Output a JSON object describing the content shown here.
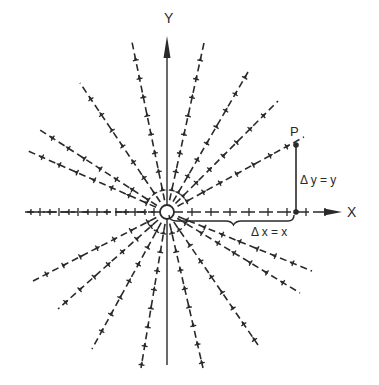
{
  "diagram": {
    "type": "radial vector field",
    "origin": [
      167,
      212
    ],
    "axes": {
      "x_label": "X",
      "y_label": "Y"
    },
    "point": {
      "label": "P",
      "position": [
        296,
        145
      ]
    },
    "annotations": {
      "delta_x": "Δ x = x",
      "delta_y": "Δ y = y"
    },
    "colors": {
      "ink": "#2a2a2a",
      "background": "#ffffff"
    },
    "rays": [
      {
        "end": [
          132,
          42
        ],
        "dir": "out"
      },
      {
        "end": [
          204,
          43
        ],
        "dir": "out"
      },
      {
        "end": [
          80,
          83
        ],
        "dir": "out"
      },
      {
        "end": [
          248,
          72
        ],
        "dir": "out"
      },
      {
        "end": [
          37,
          128
        ],
        "dir": "out"
      },
      {
        "end": [
          278,
          101
        ],
        "dir": "out"
      },
      {
        "end": [
          28,
          151
        ],
        "dir": "out"
      },
      {
        "end": [
          304,
          137
        ],
        "dir": "out"
      },
      {
        "end": [
          25,
          212
        ],
        "dir": "out"
      },
      {
        "end": [
          33,
          281
        ],
        "dir": "in"
      },
      {
        "end": [
          312,
          271
        ],
        "dir": "in"
      },
      {
        "end": [
          58,
          309
        ],
        "dir": "in"
      },
      {
        "end": [
          300,
          293
        ],
        "dir": "in"
      },
      {
        "end": [
          92,
          349
        ],
        "dir": "in"
      },
      {
        "end": [
          258,
          345
        ],
        "dir": "in"
      },
      {
        "end": [
          141,
          368
        ],
        "dir": "in"
      },
      {
        "end": [
          203,
          368
        ],
        "dir": "in"
      }
    ]
  }
}
